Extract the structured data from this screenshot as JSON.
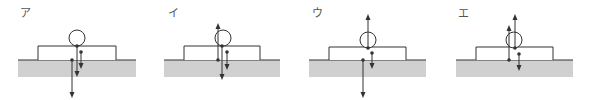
{
  "panels": [
    {
      "label": "ア",
      "label_pos": [
        20,
        14
      ],
      "ground": {
        "x": 18,
        "y": 60,
        "w": 118,
        "h": 17
      },
      "box": {
        "x": 38,
        "y": 46,
        "w": 78,
        "h": 14
      },
      "circle": {
        "cx": 77,
        "cy": 38,
        "r": 8
      },
      "arrows": [
        {
          "x1": 77,
          "y1": 46,
          "x2": 77,
          "y2": 74,
          "dir": "down"
        },
        {
          "x1": 81,
          "y1": 52,
          "x2": 81,
          "y2": 66,
          "dir": "down"
        },
        {
          "x1": 72,
          "y1": 60,
          "x2": 72,
          "y2": 95,
          "dir": "down"
        }
      ]
    },
    {
      "label": "イ",
      "label_pos": [
        168,
        14
      ],
      "ground": {
        "x": 164,
        "y": 60,
        "w": 116,
        "h": 17
      },
      "box": {
        "x": 184,
        "y": 46,
        "w": 76,
        "h": 14
      },
      "circle": {
        "cx": 223,
        "cy": 38,
        "r": 8
      },
      "arrows": [
        {
          "x1": 218,
          "y1": 60,
          "x2": 218,
          "y2": 26,
          "dir": "up"
        },
        {
          "x1": 222,
          "y1": 46,
          "x2": 222,
          "y2": 77,
          "dir": "down"
        },
        {
          "x1": 227,
          "y1": 52,
          "x2": 227,
          "y2": 67,
          "dir": "down"
        }
      ]
    },
    {
      "label": "ウ",
      "label_pos": [
        312,
        14
      ],
      "ground": {
        "x": 309,
        "y": 60,
        "w": 117,
        "h": 17
      },
      "box": {
        "x": 329,
        "y": 47,
        "w": 77,
        "h": 13
      },
      "circle": {
        "cx": 368,
        "cy": 40,
        "r": 8
      },
      "arrows": [
        {
          "x1": 368,
          "y1": 48,
          "x2": 368,
          "y2": 17,
          "dir": "up"
        },
        {
          "x1": 372,
          "y1": 53,
          "x2": 372,
          "y2": 66,
          "dir": "down"
        },
        {
          "x1": 363,
          "y1": 60,
          "x2": 363,
          "y2": 95,
          "dir": "down"
        }
      ]
    },
    {
      "label": "エ",
      "label_pos": [
        458,
        14
      ],
      "ground": {
        "x": 456,
        "y": 60,
        "w": 117,
        "h": 17
      },
      "box": {
        "x": 476,
        "y": 47,
        "w": 77,
        "h": 13
      },
      "circle": {
        "cx": 514,
        "cy": 40,
        "r": 8
      },
      "arrows": [
        {
          "x1": 515,
          "y1": 48,
          "x2": 515,
          "y2": 17,
          "dir": "up"
        },
        {
          "x1": 509,
          "y1": 60,
          "x2": 509,
          "y2": 28,
          "dir": "up"
        },
        {
          "x1": 519,
          "y1": 54,
          "x2": 519,
          "y2": 68,
          "dir": "down"
        }
      ]
    }
  ],
  "colors": {
    "line": "#333333",
    "ground_fill": "#d0d0d0",
    "box_fill": "#ffffff",
    "label": "#555555"
  }
}
